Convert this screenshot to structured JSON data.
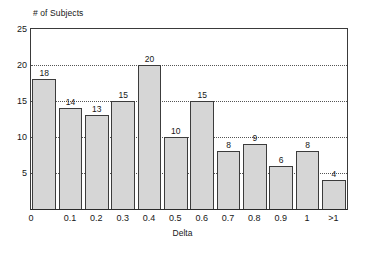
{
  "chart_data": {
    "type": "bar",
    "title": "",
    "xlabel": "Delta",
    "ylabel": "# of Subjects",
    "categories": [
      "0",
      "0.1",
      "0.2",
      "0.3",
      "0.4",
      "0.5",
      "0.6",
      "0.7",
      "0.8",
      "0.9",
      "1",
      ">1"
    ],
    "values": [
      18,
      14,
      13,
      15,
      20,
      10,
      15,
      8,
      9,
      6,
      8,
      4
    ],
    "data_labels": [
      "18",
      "14",
      "13",
      "15",
      "20",
      "10",
      "15",
      "8",
      "9",
      "6",
      "8",
      "4"
    ],
    "ylim": [
      0,
      25
    ],
    "yticks": [
      5,
      10,
      15,
      20,
      25
    ],
    "ytick_labels": [
      "5",
      "10",
      "15",
      "20",
      "25"
    ],
    "grid": "horizontal-dotted",
    "legend": "none",
    "bar_fill_color": "#d6d6d6",
    "bar_edge_color": "#3c3c3c",
    "gridline_color": "#555555",
    "axis_color": "#3a3a3a",
    "background_color": "#ffffff"
  },
  "axes": {
    "y_caption": "# of Subjects",
    "x_caption": "Delta"
  }
}
